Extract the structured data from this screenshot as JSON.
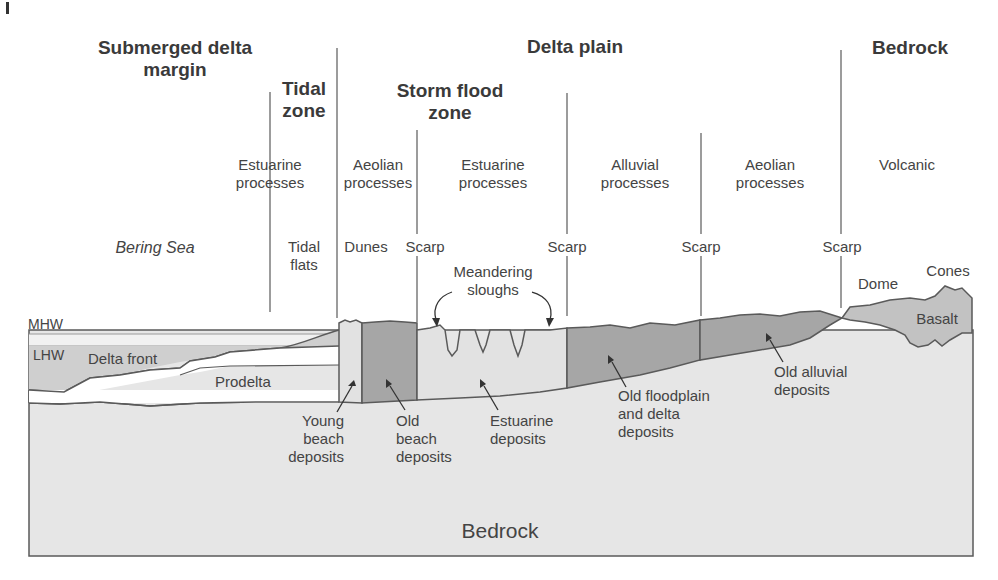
{
  "figure": {
    "type": "geologic cross-section"
  },
  "headers": {
    "submerged": "Submerged delta margin",
    "submerged_l1": "Submerged delta",
    "submerged_l2": "margin",
    "tidal_l1": "Tidal",
    "tidal_l2": "zone",
    "delta_plain": "Delta plain",
    "storm_l1": "Storm flood",
    "storm_l2": "zone",
    "bedrock": "Bedrock"
  },
  "processes": [
    {
      "l1": "Estuarine",
      "l2": "processes"
    },
    {
      "l1": "Aeolian",
      "l2": "processes"
    },
    {
      "l1": "Estuarine",
      "l2": "processes"
    },
    {
      "l1": "Alluvial",
      "l2": "processes"
    },
    {
      "l1": "Aeolian",
      "l2": "processes"
    },
    {
      "l1": "Volcanic",
      "l2": ""
    }
  ],
  "features": {
    "bering_sea": "Bering Sea",
    "tidal_flats_l1": "Tidal",
    "tidal_flats_l2": "flats",
    "dunes": "Dunes",
    "scarp": "Scarp",
    "meandering_l1": "Meandering",
    "meandering_l2": "sloughs",
    "dome": "Dome",
    "cones": "Cones",
    "basalt": "Basalt",
    "mhw": "MHW",
    "lhw": "LHW",
    "delta_front": "Delta front",
    "prodelta": "Prodelta"
  },
  "deposits": {
    "young_beach": [
      "Young",
      "beach",
      "deposits"
    ],
    "old_beach": [
      "Old",
      "beach",
      "deposits"
    ],
    "estuarine": [
      "Estuarine",
      "deposits"
    ],
    "old_floodplain": [
      "Old floodplain",
      "and delta",
      "deposits"
    ],
    "old_alluvial": [
      "Old alluvial",
      "deposits"
    ],
    "bedrock": "Bedrock"
  },
  "colors": {
    "light_fill": "#e6e6e6",
    "medium_fill": "#c8c8c8",
    "dark_fill": "#a6a6a6",
    "water_band": "#f1f1f1",
    "line": "#5a5a5a",
    "text": "#444444"
  }
}
